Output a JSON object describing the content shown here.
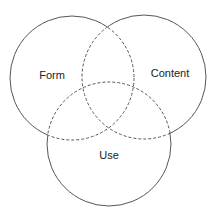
{
  "diagram": {
    "type": "venn",
    "stroke_color": "#555555",
    "text_color": "#222222",
    "background": "#ffffff",
    "sets": [
      {
        "id": "form",
        "label": "Form",
        "cx": 72,
        "cy": 78,
        "r": 62,
        "label_x": 52,
        "label_y": 79
      },
      {
        "id": "content",
        "label": "Content",
        "cx": 144,
        "cy": 77,
        "r": 62,
        "label_x": 170,
        "label_y": 77
      },
      {
        "id": "use",
        "label": "Use",
        "cx": 109,
        "cy": 144,
        "r": 62,
        "label_x": 109,
        "label_y": 159
      }
    ],
    "overlap_style": "dashed"
  }
}
